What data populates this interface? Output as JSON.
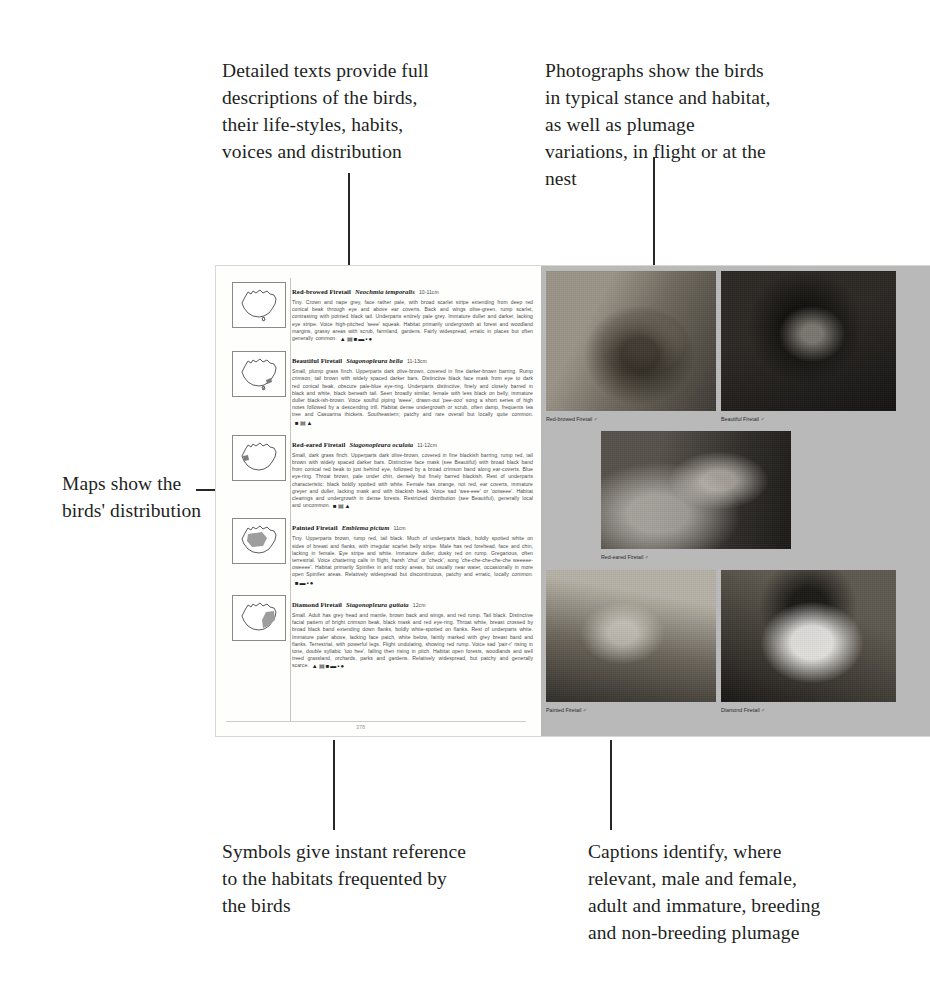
{
  "annotations": {
    "detailed_texts": "Detailed texts provide full descriptions of the birds, their life-styles, habits, voices and distribution",
    "photographs": "Photographs show the birds in typical stance and habitat, as well as plumage variations, in flight or at the nest",
    "maps": "Maps show the birds' distribution",
    "symbols": "Symbols give instant reference to the habitats frequented by the birds",
    "captions": "Captions identify, where relevant, male and female, adult and immature, breeding and non-breeding plumage"
  },
  "page": {
    "folio": "378",
    "map_label": "australia-distribution-map",
    "species": [
      {
        "name": "Red-browed Firetail",
        "latin": "Neochmia temporalis",
        "size": "10-11cm",
        "text": "Tiny. Crown and nape grey, face rather pale, with broad scarlet stripe extending from deep red conical beak through eye and above ear coverts. Back and wings olive-green, rump scarlet, contrasting with pointed black tail. Underparts entirely pale grey. Immature duller and darker, lacking eye stripe. Voice high-pitched 'seee' squeak. Habitat primarily undergrowth at forest and woodland margins, grassy areas with scrub, farmland, gardens. Fairly widespread, erratic in places but often generally common.",
        "symbols": "habitat-symbols"
      },
      {
        "name": "Beautiful Firetail",
        "latin": "Stagonopleura bella",
        "size": "11-13cm",
        "text": "Small, plump grass finch. Upperparts dark olive-brown, covered in fine darker-brown barring. Rump crimson, tail brown with widely spaced darker bars. Distinctive black face mask from eye to dark red conical beak, obscure pale-blue eye-ring. Underparts distinctive, finely and closely barred in black and white, black beneath tail. Seen broadly similar, female with less black on belly, immature duller black-ish-brown. Voice soulful piping 'weee', drawn-out 'pee-ooo' song a short series of high notes followed by a descending trill. Habitat dense undergrowth or scrub, often damp, frequents tea tree and Casuarina thickets. Southeastern; patchy and rare overall but locally quite common.",
        "symbols": "habitat-symbols"
      },
      {
        "name": "Red-eared Firetail",
        "latin": "Stagonopleura oculata",
        "size": "11-12cm",
        "text": "Small, dark grass finch. Upperparts dark olive-brown, covered in fine blackish barring, rump red, tail brown with widely spaced darker bars. Distinctive face mask (see Beautiful) with broad black band from conical red beak to just behind eye, followed by a broad crimson band along ear-coverts. Blue eye-ring. Throat brown, pale under chin, densely but finely barred blackish. Rest of underparts characteristic: black boldly spotted with white. Female has orange, not red, ear coverts, immature greyer and duller, lacking mask and with blackish beak. Voice sad 'wee-eee' or 'ooiweee'. Habitat clearings and undergrowth in dense forests. Restricted distribution (see Beautiful), generally local and uncommon.",
        "symbols": "habitat-symbols"
      },
      {
        "name": "Painted Firetail",
        "latin": "Emblema pictum",
        "size": "11cm",
        "text": "Tiny. Upperparts brown, rump red, tail black. Much of underparts black, boldly spotted white on sides of breast and flanks, with irregular scarlet belly stripe. Male has red forehead, face and chin, lacking in female. Eye stripe and white. Immature duller, dusky red on rump. Gregarious, often terrestrial. Voice chattering calls in flight, harsh 'chut' or 'check', song 'che-che-che-che-che weeeee-oweeee'. Habitat primarily Spinifex in arid rocky areas, but usually near water, occasionally in more open Spinifex areas. Relatively widespread but discontinuous, patchy and erratic, locally common.",
        "symbols": "habitat-symbols"
      },
      {
        "name": "Diamond Firetail",
        "latin": "Stagonopleura guttata",
        "size": "12cm",
        "text": "Small. Adult has grey head and mantle, brown back and wings, and red rump. Tail black. Distinctive facial pattern of bright crimson beak, black mask and red eye-ring. Throat white, breast crossed by broad black band extending down flanks, boldly white-spotted on flanks. Rest of underparts white. Immature paler above, lacking face patch, white below, faintly marked with grey breast band and flanks. Terrestrial, with powerful legs. Flight undulating, showing red rump. Voice sad 'pair-r' rising in tone, double syllabic 'too hee', falling then rising in pitch. Habitat open forests, woodlands and well treed grassland, orchards, parks and gardens. Relatively widespread, but patchy and generally scarce.",
        "symbols": "habitat-symbols"
      }
    ],
    "photo_captions": [
      "Red-browed Firetail ♂",
      "Beautiful Firetail ♂",
      "Red-eared Firetail ♂",
      "Painted Firetail ♂",
      "Diamond Firetail ♂"
    ]
  },
  "colors": {
    "page_background": "#fdfdfc",
    "photo_panel": "#b9b9b9",
    "text_ink": "#231f1e",
    "body_ink": "#4a4a4a"
  }
}
